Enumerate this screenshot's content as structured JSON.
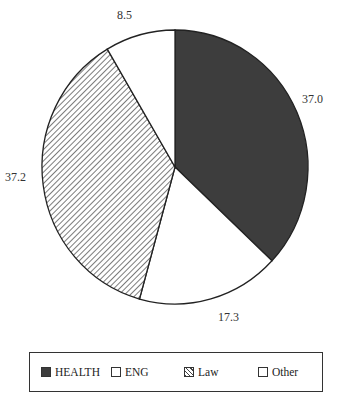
{
  "chart_data": {
    "type": "pie",
    "title": "",
    "categories": [
      "HEALTH",
      "ENG",
      "Law",
      "Other"
    ],
    "values": [
      37.0,
      17.3,
      37.2,
      8.5
    ],
    "labels": [
      "37.0",
      "17.3",
      "37.2",
      "8.5"
    ],
    "fills": [
      "#3d3d3d",
      "#ffffff",
      "hatch",
      "#ffffff"
    ],
    "start_angle": "12 o'clock, clockwise",
    "legend_position": "bottom"
  },
  "legend": {
    "items": [
      {
        "label": "HEALTH"
      },
      {
        "label": "ENG"
      },
      {
        "label": "Law"
      },
      {
        "label": "Other"
      }
    ]
  }
}
